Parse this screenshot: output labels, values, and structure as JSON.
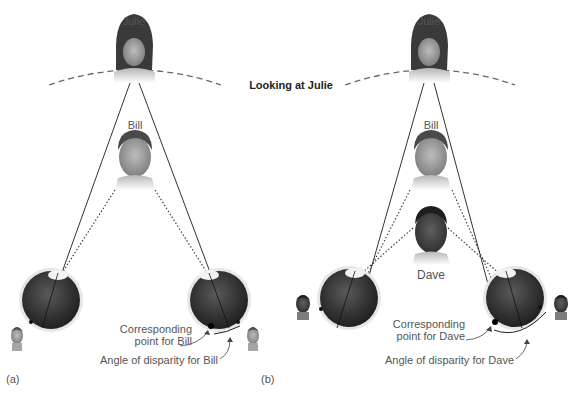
{
  "figure": {
    "title": "Looking at Julie",
    "panels": [
      {
        "tag": "(a)",
        "fixated_person": "Julie",
        "near_person": "Bill",
        "persons": [
          {
            "name": "Julie",
            "role": "fixated",
            "label_visible": true
          },
          {
            "name": "Bill",
            "role": "nearer object",
            "label_visible": true
          }
        ],
        "annotations": {
          "corresponding_point": "Corresponding\npoint for Bill",
          "corresponding_point_line1": "Corresponding",
          "corresponding_point_line2": "point for Bill",
          "angle_of_disparity": "Angle of disparity for Bill"
        },
        "retinal_images": [
          "Bill (left eye image)",
          "Bill (right eye image)"
        ]
      },
      {
        "tag": "(b)",
        "fixated_person": "Julie",
        "near_person": "Dave",
        "persons": [
          {
            "name": "Julie",
            "role": "fixated",
            "label_visible": true
          },
          {
            "name": "Bill",
            "role": "nearer object",
            "label_visible": true
          },
          {
            "name": "Dave",
            "role": "nearest object",
            "label_visible": true
          }
        ],
        "annotations": {
          "corresponding_point_line1": "Corresponding",
          "corresponding_point_line2": "point for Dave",
          "angle_of_disparity": "Angle of disparity for Dave"
        },
        "retinal_images": [
          "Dave (left eye image)",
          "Dave (right eye image)"
        ]
      }
    ],
    "legend": {
      "solid_line": "line of sight to Julie (fixation)",
      "dotted_line": "line of sight to nearer person",
      "dashed_arc": "horopter"
    },
    "colors": {
      "background": "#ffffff",
      "line": "#333333",
      "eye_dark": "#2a2a2a",
      "eye_rim": "#d8d8d8",
      "label_text": "#555555",
      "title_text": "#222222"
    }
  }
}
